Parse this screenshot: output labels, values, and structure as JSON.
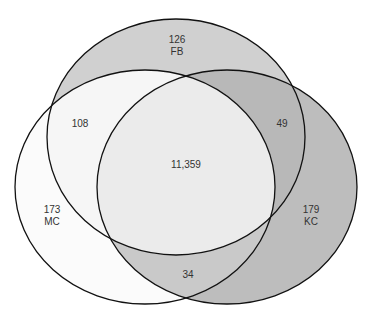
{
  "sets": [
    {
      "name": "FB",
      "count": "126",
      "fill": "#cfcfcf"
    },
    {
      "name": "MC",
      "count": "173",
      "fill": "#fbfbfb"
    },
    {
      "name": "KC",
      "count": "179",
      "fill": "#bdbdbd"
    }
  ],
  "intersections": {
    "fb_mc": "108",
    "fb_kc": "49",
    "mc_kc": "34",
    "all": "11,359"
  }
}
